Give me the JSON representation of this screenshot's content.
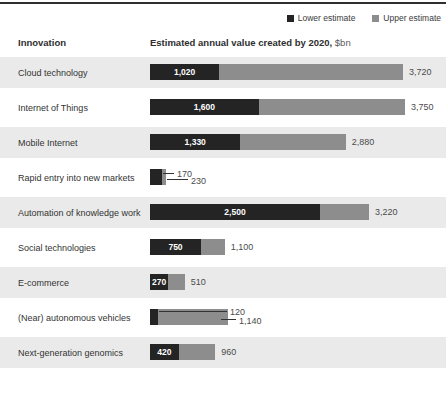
{
  "legend": {
    "lower_label": "Lower estimate",
    "upper_label": "Upper estimate"
  },
  "header": {
    "innovation": "Innovation",
    "value_title": "Estimated annual value created by 2020,",
    "value_unit": " $bn"
  },
  "colors": {
    "lower_bar": "#242424",
    "upper_bar": "#8d8d8d",
    "row_band": "#eaeaea",
    "top_rule": "#2f2f2f",
    "text": "#333333"
  },
  "chart_data": {
    "type": "bar",
    "orientation": "horizontal",
    "title": "Estimated annual value created by 2020, $bn",
    "unit": "$bn",
    "legend_position": "top-right",
    "categories": [
      "Cloud technology",
      "Internet of Things",
      "Mobile Internet",
      "Rapid entry into new markets",
      "Automation of knowledge work",
      "Social technologies",
      "E-commerce",
      "(Near) autonomous vehicles",
      "Next-generation genomics"
    ],
    "series": [
      {
        "name": "Lower estimate",
        "values": [
          1020,
          1600,
          1330,
          170,
          2500,
          750,
          270,
          120,
          420
        ]
      },
      {
        "name": "Upper estimate",
        "values": [
          3720,
          3750,
          2880,
          230,
          3220,
          1100,
          510,
          1140,
          960
        ]
      }
    ],
    "value_labels": {
      "lower": [
        "1,020",
        "1,600",
        "1,330",
        "170",
        "2,500",
        "750",
        "270",
        "120",
        "420"
      ],
      "upper": [
        "3,720",
        "3,750",
        "2,880",
        "230",
        "3,220",
        "1,100",
        "510",
        "1,140",
        "960"
      ]
    },
    "xlim": [
      0,
      3750
    ],
    "shaded_rows": [
      0,
      2,
      4,
      6,
      8
    ],
    "callout_rows": [
      3,
      7
    ]
  }
}
